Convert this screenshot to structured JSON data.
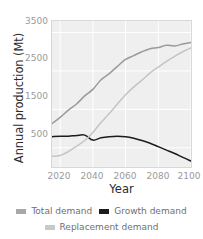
{
  "chart_data": {
    "type": "line",
    "title": "",
    "xlabel": "Year",
    "ylabel": "Annual production (Mt)",
    "xlim": [
      2015,
      2100
    ],
    "ylim": [
      0,
      3800
    ],
    "xticks": [
      2020,
      2040,
      2060,
      2080,
      2100
    ],
    "yticks": [
      500,
      1500,
      2500,
      3500
    ],
    "grid": true,
    "legend_position": "bottom",
    "x": [
      2015,
      2020,
      2025,
      2030,
      2035,
      2040,
      2045,
      2050,
      2055,
      2060,
      2065,
      2070,
      2075,
      2080,
      2085,
      2090,
      2095,
      2100
    ],
    "series": [
      {
        "name": "Total demand",
        "color": "#9a9a9a",
        "values": [
          1130,
          1290,
          1480,
          1640,
          1850,
          2020,
          2270,
          2430,
          2620,
          2800,
          2900,
          3000,
          3080,
          3110,
          3170,
          3150,
          3200,
          3240
        ]
      },
      {
        "name": "Growth demand",
        "color": "#1c1c1c",
        "values": [
          790,
          800,
          800,
          820,
          830,
          700,
          760,
          790,
          800,
          790,
          750,
          690,
          620,
          530,
          440,
          350,
          250,
          155
        ]
      },
      {
        "name": "Replacement demand",
        "color": "#c4c4c4",
        "values": [
          280,
          300,
          400,
          540,
          690,
          900,
          1160,
          1390,
          1640,
          1880,
          2080,
          2260,
          2450,
          2600,
          2750,
          2880,
          3000,
          3100
        ]
      }
    ]
  },
  "axes": {
    "ylabel": "Annual production (Mt)",
    "xlabel": "Year",
    "yticks": [
      "3500",
      "2500",
      "1500",
      "500"
    ],
    "xticks": [
      "2020",
      "2040",
      "2060",
      "2080",
      "2100"
    ]
  },
  "legend": {
    "row1": [
      {
        "label": "Total demand",
        "color": "#a8a8a8"
      },
      {
        "label": "Growth demand",
        "color": "#1c1c1c"
      }
    ],
    "row2": [
      {
        "label": "Replacement demand",
        "color": "#c9c9c9"
      }
    ]
  },
  "style": {
    "plot_background": "#efefef",
    "gridline_color": "#ffffff",
    "tick_text_color": "#9a9a9a",
    "axis_title_color": "#2b2b2b"
  }
}
